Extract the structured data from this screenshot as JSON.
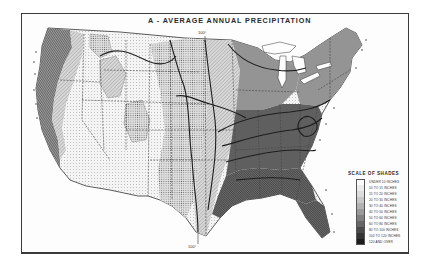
{
  "map": {
    "title": "A - AVERAGE ANNUAL PRECIPITATION",
    "subject": "United States",
    "meridian_labels": {
      "top": "100°",
      "bottom": "100°"
    },
    "colors": {
      "frame": "#3a3a3a",
      "ink": "#2a2a2a",
      "paper": "#fdfdfd",
      "isohyet": "#1e1e1e",
      "state_line": "#444444"
    },
    "legend": {
      "title": "SCALE OF SHADES",
      "classes": [
        {
          "label": "UNDER 10 INCHES",
          "fill": "#fbfbfb"
        },
        {
          "label": "10 TO 15 INCHES",
          "fill": "#ececec"
        },
        {
          "label": "15 TO 20 INCHES",
          "fill": "#dcdcdc"
        },
        {
          "label": "20 TO 30 INCHES",
          "fill": "#c8c8c8"
        },
        {
          "label": "30 TO 40 INCHES",
          "fill": "#b2b2b2"
        },
        {
          "label": "40 TO 50 INCHES",
          "fill": "#9a9a9a"
        },
        {
          "label": "50 TO 60 INCHES",
          "fill": "#808080"
        },
        {
          "label": "60 TO 80 INCHES",
          "fill": "#666666"
        },
        {
          "label": "80 TO 100 INCHES",
          "fill": "#4a4a4a"
        },
        {
          "label": "100 TO 120 INCHES",
          "fill": "#343434"
        },
        {
          "label": "120 AND OVER",
          "fill": "#1c1c1c"
        }
      ]
    }
  }
}
